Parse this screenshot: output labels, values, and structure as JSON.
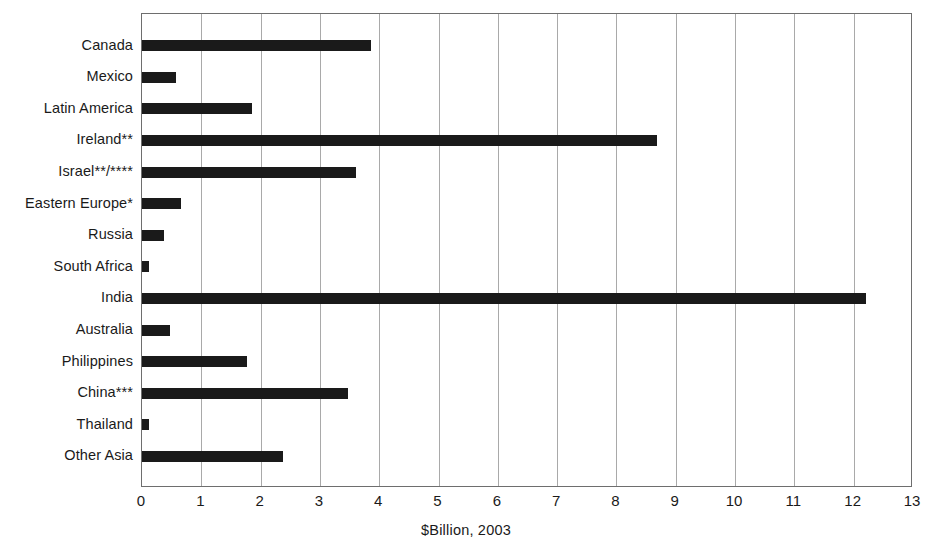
{
  "chart_data": {
    "type": "bar",
    "orientation": "horizontal",
    "title": "",
    "subtitle": "",
    "xlabel": "$Billion, 2003",
    "ylabel": "",
    "xlim": [
      0,
      13
    ],
    "ylim": null,
    "grid": "vertical",
    "legend": null,
    "legend_position": "none",
    "bar_color": "#1a1a1a",
    "gridline_color": "#a9a9a9",
    "axis_color": "#6e6e6e",
    "background_color": "#ffffff",
    "xticks": [
      "0",
      "1",
      "2",
      "3",
      "4",
      "5",
      "6",
      "7",
      "8",
      "9",
      "10",
      "11",
      "12",
      "13"
    ],
    "xtick_values": [
      0,
      1,
      2,
      3,
      4,
      5,
      6,
      7,
      8,
      9,
      10,
      11,
      12,
      13
    ],
    "categories": [
      "Canada",
      "Mexico",
      "Latin America",
      "Ireland**",
      "Israel**/****",
      "Eastern Europe*",
      "Russia",
      "South Africa",
      "India",
      "Australia",
      "Philippines",
      "China***",
      "Thailand",
      "Other Asia"
    ],
    "values": [
      3.86,
      0.57,
      1.85,
      8.68,
      3.6,
      0.65,
      0.37,
      0.12,
      12.2,
      0.47,
      1.77,
      3.47,
      0.12,
      2.38
    ],
    "annotations": []
  }
}
